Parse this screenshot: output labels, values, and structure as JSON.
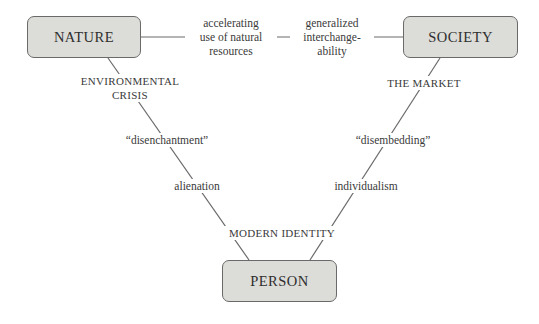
{
  "diagram": {
    "nodes": {
      "nature": "NATURE",
      "society": "SOCIETY",
      "person": "PERSON"
    },
    "top_edge": {
      "left_label": [
        "accelerating",
        "use of natural",
        "resources"
      ],
      "right_label": [
        "generalized",
        "interchange-",
        "ability"
      ]
    },
    "left_edge": {
      "labels": [
        "ENVIRONMENTAL",
        "CRISIS",
        "“disenchantment”",
        "alienation"
      ]
    },
    "right_edge": {
      "labels": [
        "THE MARKET",
        "“disembedding”",
        "individualism"
      ]
    },
    "bottom_label": "MODERN IDENTITY",
    "colors": {
      "box_fill": "#dcdcd8",
      "box_border": "#6a6a6a",
      "line": "#6a6a6a",
      "text": "#3a3a3a"
    }
  }
}
